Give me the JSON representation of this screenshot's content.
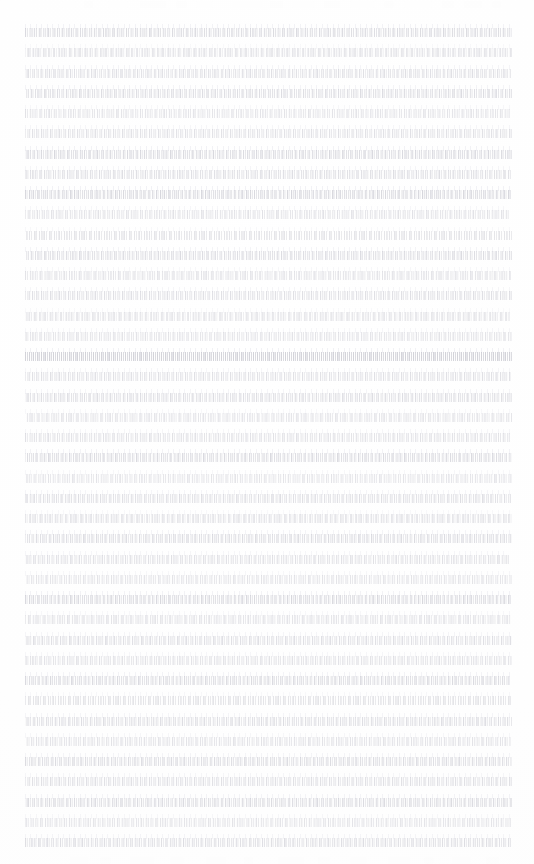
{
  "document": {
    "kind": "scanned-page",
    "condition": "severely-faded",
    "legible_text": false,
    "page": {
      "width": 534,
      "height": 864,
      "background_color": "#fefefe"
    },
    "text_block": {
      "left": 25,
      "right": 512,
      "width": 487,
      "first_line_y": 28,
      "last_line_y": 854,
      "line_spacing": 20.2,
      "line_count": 41,
      "alignment": "justified",
      "paragraph_indent": 0,
      "ink_color_light": "#e8e8ec",
      "ink_color_dark": "#babac4"
    },
    "header_band": {
      "top": 0,
      "height": 9,
      "legible": false,
      "ink_color": "#fdfdfd"
    },
    "footer_band": {
      "height": 8,
      "legible": false,
      "ink_color": "#fdfdfd"
    }
  },
  "header_marks": [
    {
      "x": 62,
      "w": 14,
      "o": 0.55
    },
    {
      "x": 84,
      "w": 9,
      "o": 0.4
    },
    {
      "x": 108,
      "w": 20,
      "o": 0.5
    },
    {
      "x": 140,
      "w": 26,
      "o": 0.45
    },
    {
      "x": 176,
      "w": 11,
      "o": 0.35
    },
    {
      "x": 196,
      "w": 17,
      "o": 0.5
    },
    {
      "x": 232,
      "w": 30,
      "o": 0.6
    },
    {
      "x": 270,
      "w": 13,
      "o": 0.45
    },
    {
      "x": 292,
      "w": 22,
      "o": 0.55
    },
    {
      "x": 324,
      "w": 16,
      "o": 0.4
    },
    {
      "x": 350,
      "w": 24,
      "o": 0.5
    },
    {
      "x": 384,
      "w": 10,
      "o": 0.35
    },
    {
      "x": 404,
      "w": 28,
      "o": 0.55
    },
    {
      "x": 442,
      "w": 12,
      "o": 0.4
    },
    {
      "x": 464,
      "w": 18,
      "o": 0.45
    },
    {
      "x": 492,
      "w": 9,
      "o": 0.35
    }
  ],
  "footer_marks": [
    {
      "x": 70,
      "w": 18,
      "o": 0.4
    },
    {
      "x": 100,
      "w": 11,
      "o": 0.3
    },
    {
      "x": 130,
      "w": 24,
      "o": 0.45
    },
    {
      "x": 170,
      "w": 14,
      "o": 0.35
    },
    {
      "x": 206,
      "w": 20,
      "o": 0.4
    },
    {
      "x": 244,
      "w": 9,
      "o": 0.28
    },
    {
      "x": 278,
      "w": 26,
      "o": 0.42
    },
    {
      "x": 318,
      "w": 12,
      "o": 0.32
    },
    {
      "x": 350,
      "w": 17,
      "o": 0.38
    },
    {
      "x": 388,
      "w": 22,
      "o": 0.44
    },
    {
      "x": 424,
      "w": 10,
      "o": 0.3
    },
    {
      "x": 452,
      "w": 19,
      "o": 0.4
    },
    {
      "x": 486,
      "w": 13,
      "o": 0.33
    }
  ],
  "lines": [
    {
      "y": 28,
      "opacity": 0.52,
      "shift": 0,
      "pitch": 4.6,
      "run": 487,
      "haze": 0.55
    },
    {
      "y": 48,
      "opacity": 0.34,
      "shift": 2,
      "pitch": 5.2,
      "run": 487,
      "haze": 0.3
    },
    {
      "y": 69,
      "opacity": 0.46,
      "shift": 1,
      "pitch": 4.2,
      "run": 486,
      "haze": 0.48
    },
    {
      "y": 89,
      "opacity": 0.5,
      "shift": 3,
      "pitch": 4.4,
      "run": 487,
      "haze": 0.52
    },
    {
      "y": 109,
      "opacity": 0.4,
      "shift": 0,
      "pitch": 4.8,
      "run": 485,
      "haze": 0.38
    },
    {
      "y": 129,
      "opacity": 0.44,
      "shift": 2,
      "pitch": 4.5,
      "run": 487,
      "haze": 0.42
    },
    {
      "y": 150,
      "opacity": 0.55,
      "shift": 1,
      "pitch": 4.3,
      "run": 487,
      "haze": 0.58
    },
    {
      "y": 170,
      "opacity": 0.48,
      "shift": 4,
      "pitch": 4.6,
      "run": 486,
      "haze": 0.45
    },
    {
      "y": 190,
      "opacity": 0.58,
      "shift": 0,
      "pitch": 4.1,
      "run": 487,
      "haze": 0.6
    },
    {
      "y": 210,
      "opacity": 0.42,
      "shift": 2,
      "pitch": 4.7,
      "run": 484,
      "haze": 0.4
    },
    {
      "y": 231,
      "opacity": 0.36,
      "shift": 1,
      "pitch": 5.0,
      "run": 487,
      "haze": 0.33
    },
    {
      "y": 251,
      "opacity": 0.5,
      "shift": 3,
      "pitch": 4.4,
      "run": 487,
      "haze": 0.5
    },
    {
      "y": 271,
      "opacity": 0.38,
      "shift": 0,
      "pitch": 4.9,
      "run": 486,
      "haze": 0.36
    },
    {
      "y": 291,
      "opacity": 0.46,
      "shift": 2,
      "pitch": 4.5,
      "run": 487,
      "haze": 0.44
    },
    {
      "y": 312,
      "opacity": 0.33,
      "shift": 1,
      "pitch": 5.3,
      "run": 485,
      "haze": 0.3
    },
    {
      "y": 332,
      "opacity": 0.41,
      "shift": 4,
      "pitch": 4.6,
      "run": 487,
      "haze": 0.4
    },
    {
      "y": 352,
      "opacity": 0.62,
      "shift": 0,
      "pitch": 4.0,
      "run": 487,
      "haze": 0.62
    },
    {
      "y": 372,
      "opacity": 0.45,
      "shift": 2,
      "pitch": 4.5,
      "run": 486,
      "haze": 0.43
    },
    {
      "y": 393,
      "opacity": 0.49,
      "shift": 1,
      "pitch": 4.3,
      "run": 487,
      "haze": 0.48
    },
    {
      "y": 413,
      "opacity": 0.37,
      "shift": 3,
      "pitch": 4.9,
      "run": 487,
      "haze": 0.35
    },
    {
      "y": 433,
      "opacity": 0.43,
      "shift": 0,
      "pitch": 4.6,
      "run": 485,
      "haze": 0.42
    },
    {
      "y": 453,
      "opacity": 0.54,
      "shift": 2,
      "pitch": 4.2,
      "run": 487,
      "haze": 0.55
    },
    {
      "y": 474,
      "opacity": 0.39,
      "shift": 1,
      "pitch": 4.8,
      "run": 487,
      "haze": 0.37
    },
    {
      "y": 494,
      "opacity": 0.47,
      "shift": 4,
      "pitch": 4.4,
      "run": 486,
      "haze": 0.46
    },
    {
      "y": 514,
      "opacity": 0.35,
      "shift": 0,
      "pitch": 5.1,
      "run": 487,
      "haze": 0.32
    },
    {
      "y": 534,
      "opacity": 0.51,
      "shift": 2,
      "pitch": 4.3,
      "run": 487,
      "haze": 0.5
    },
    {
      "y": 555,
      "opacity": 0.44,
      "shift": 1,
      "pitch": 4.6,
      "run": 484,
      "haze": 0.42
    },
    {
      "y": 575,
      "opacity": 0.4,
      "shift": 3,
      "pitch": 4.7,
      "run": 487,
      "haze": 0.38
    },
    {
      "y": 595,
      "opacity": 0.56,
      "shift": 0,
      "pitch": 4.1,
      "run": 487,
      "haze": 0.57
    },
    {
      "y": 615,
      "opacity": 0.38,
      "shift": 2,
      "pitch": 4.9,
      "run": 486,
      "haze": 0.36
    },
    {
      "y": 636,
      "opacity": 0.46,
      "shift": 1,
      "pitch": 4.5,
      "run": 487,
      "haze": 0.45
    },
    {
      "y": 656,
      "opacity": 0.42,
      "shift": 4,
      "pitch": 4.6,
      "run": 487,
      "haze": 0.4
    },
    {
      "y": 676,
      "opacity": 0.53,
      "shift": 0,
      "pitch": 4.2,
      "run": 485,
      "haze": 0.54
    },
    {
      "y": 696,
      "opacity": 0.36,
      "shift": 2,
      "pitch": 5.0,
      "run": 487,
      "haze": 0.34
    },
    {
      "y": 717,
      "opacity": 0.48,
      "shift": 1,
      "pitch": 4.4,
      "run": 487,
      "haze": 0.47
    },
    {
      "y": 737,
      "opacity": 0.41,
      "shift": 3,
      "pitch": 4.7,
      "run": 486,
      "haze": 0.39
    },
    {
      "y": 757,
      "opacity": 0.5,
      "shift": 0,
      "pitch": 4.3,
      "run": 487,
      "haze": 0.49
    },
    {
      "y": 777,
      "opacity": 0.45,
      "shift": 2,
      "pitch": 4.5,
      "run": 487,
      "haze": 0.44
    },
    {
      "y": 798,
      "opacity": 0.52,
      "shift": 1,
      "pitch": 4.2,
      "run": 487,
      "haze": 0.52
    },
    {
      "y": 818,
      "opacity": 0.39,
      "shift": 4,
      "pitch": 4.8,
      "run": 486,
      "haze": 0.37
    },
    {
      "y": 838,
      "opacity": 0.47,
      "shift": 0,
      "pitch": 4.4,
      "run": 487,
      "haze": 0.46
    }
  ]
}
